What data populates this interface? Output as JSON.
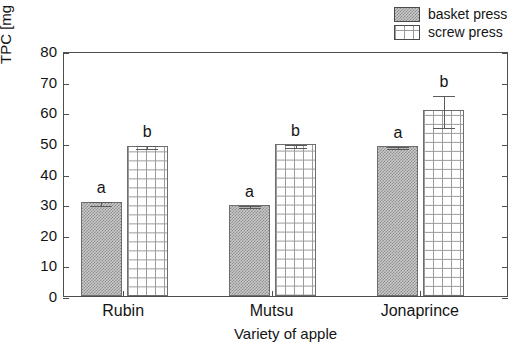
{
  "chart_data": {
    "type": "bar",
    "title": "",
    "xlabel": "Variety of apple",
    "ylabel": "TPC [mg GAE 100 ml-1]",
    "ylabel_main": "TPC [mg GAE 100 ml",
    "ylabel_sup": "-1",
    "ylabel_tail": "]",
    "categories": [
      "Rubin",
      "Mutsu",
      "Jonaprince"
    ],
    "ylim": [
      0,
      80
    ],
    "yticks": [
      0,
      10,
      20,
      30,
      40,
      50,
      60,
      70,
      80
    ],
    "ytick_labels": [
      "0",
      "10",
      "20",
      "30",
      "40",
      "50",
      "60",
      "70",
      "80"
    ],
    "grid": false,
    "legend_position": "top-right",
    "series": [
      {
        "name": "basket press",
        "fill": "gray-dotted",
        "color": "#c9c9c9",
        "values": [
          30.7,
          29.7,
          48.9
        ],
        "errors": [
          0.8,
          0.3,
          0.4
        ],
        "letters": [
          "a",
          "a",
          "a"
        ]
      },
      {
        "name": "screw press",
        "fill": "white-grid",
        "color": "#ffffff",
        "values": [
          49.1,
          49.5,
          60.7
        ],
        "errors": [
          0.4,
          0.6,
          5.2
        ],
        "letters": [
          "b",
          "b",
          "b"
        ]
      }
    ]
  },
  "legend": {
    "items": [
      {
        "label": "basket press"
      },
      {
        "label": "screw press"
      }
    ]
  },
  "axes": {
    "y_title_main": "TPC [mg GAE 100 ml",
    "y_title_sup": "-1",
    "y_title_tail": "]",
    "x_title": "Variety of apple"
  }
}
